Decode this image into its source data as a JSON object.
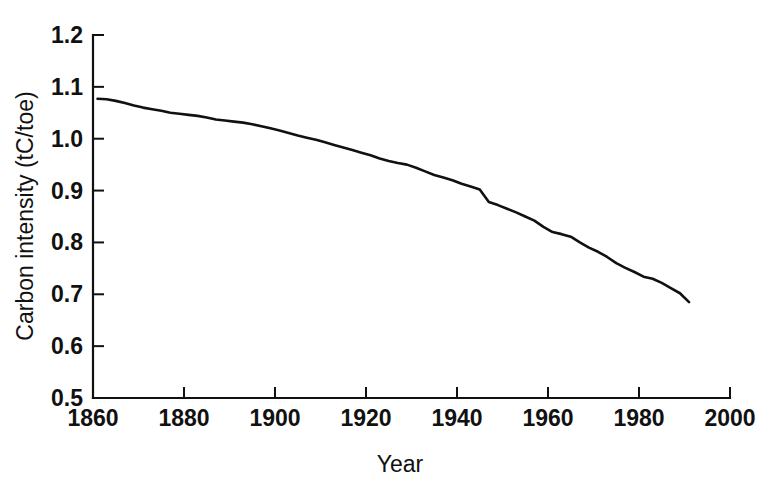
{
  "chart_data": {
    "type": "line",
    "title": "",
    "subtitle": "",
    "xlabel": "Year",
    "ylabel": "Carbon intensity (tC/toe)",
    "xlim": [
      1860,
      2000
    ],
    "ylim": [
      0.5,
      1.2
    ],
    "xticks": [
      1860,
      1880,
      1900,
      1920,
      1940,
      1960,
      1980,
      2000
    ],
    "xtick_labels": [
      "1860",
      "1880",
      "1900",
      "1920",
      "1940",
      "1960",
      "1980",
      "2000"
    ],
    "yticks": [
      0.5,
      0.6,
      0.7,
      0.8,
      0.9,
      1.0,
      1.1,
      1.2
    ],
    "ytick_labels": [
      "0.5",
      "0.6",
      "0.7",
      "0.8",
      "0.9",
      "1.0",
      "1.1",
      "1.2"
    ],
    "grid": false,
    "legend": false,
    "legend_position": "none",
    "spines": [
      "left",
      "bottom"
    ],
    "tick_direction": "in",
    "line_color": "#111111",
    "background_color": "#ffffff",
    "series": [
      {
        "name": "Carbon intensity",
        "x": [
          1861,
          1863,
          1865,
          1867,
          1869,
          1871,
          1873,
          1875,
          1877,
          1879,
          1881,
          1883,
          1885,
          1887,
          1889,
          1891,
          1893,
          1895,
          1897,
          1899,
          1901,
          1903,
          1905,
          1907,
          1909,
          1911,
          1913,
          1915,
          1917,
          1919,
          1921,
          1923,
          1925,
          1927,
          1929,
          1931,
          1933,
          1935,
          1937,
          1939,
          1941,
          1943,
          1945,
          1947,
          1949,
          1951,
          1953,
          1955,
          1957,
          1959,
          1961,
          1963,
          1965,
          1967,
          1969,
          1971,
          1973,
          1975,
          1977,
          1979,
          1981,
          1983,
          1985,
          1987,
          1989,
          1991
        ],
        "values": [
          1.077,
          1.076,
          1.073,
          1.069,
          1.064,
          1.06,
          1.057,
          1.054,
          1.05,
          1.048,
          1.046,
          1.044,
          1.041,
          1.037,
          1.035,
          1.033,
          1.031,
          1.028,
          1.024,
          1.02,
          1.016,
          1.011,
          1.006,
          1.002,
          0.998,
          0.993,
          0.988,
          0.983,
          0.978,
          0.973,
          0.968,
          0.962,
          0.957,
          0.953,
          0.95,
          0.944,
          0.937,
          0.93,
          0.925,
          0.92,
          0.913,
          0.908,
          0.902,
          0.878,
          0.872,
          0.865,
          0.858,
          0.85,
          0.842,
          0.83,
          0.82,
          0.816,
          0.811,
          0.8,
          0.79,
          0.782,
          0.772,
          0.76,
          0.751,
          0.743,
          0.734,
          0.73,
          0.722,
          0.712,
          0.702,
          0.685
        ]
      }
    ],
    "annotations": []
  },
  "axes": {
    "ylabel": "Carbon intensity (tC/toe)",
    "xlabel": "Year"
  }
}
